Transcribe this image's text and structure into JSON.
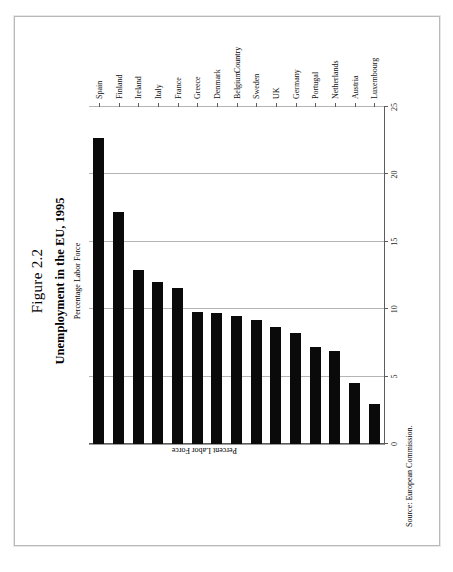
{
  "page": {
    "source_note": "Source: European Commission."
  },
  "titles": {
    "figure_number": "Figure 2.2",
    "title": "Unemployment in the EU, 1995",
    "subtitle": "Percentage Labor Force"
  },
  "axes": {
    "value_axis_label": "Percent Labor Force",
    "category_axis_label": "Country",
    "value_ticks": [
      "0",
      "5",
      "10",
      "15",
      "20",
      "25"
    ]
  },
  "chart_data": {
    "type": "bar",
    "orientation": "horizontal",
    "title": "Unemployment in the EU, 1995",
    "subtitle": "Percentage Labor Force",
    "xlabel": "Percent Labor Force",
    "ylabel": "Country",
    "xlim": [
      0,
      25
    ],
    "grid": true,
    "legend": null,
    "bar_color": "#0a0a0a",
    "categories": [
      "Spain",
      "Finland",
      "Ireland",
      "Italy",
      "France",
      "Greece",
      "Denmark",
      "Belgium",
      "Sweden",
      "UK",
      "Germany",
      "Portugal",
      "Netherlands",
      "Austria",
      "Luxembourg"
    ],
    "values": [
      22.7,
      17.2,
      12.9,
      12.0,
      11.6,
      9.8,
      9.7,
      9.5,
      9.2,
      8.7,
      8.2,
      7.2,
      6.9,
      4.5,
      3.0
    ]
  }
}
